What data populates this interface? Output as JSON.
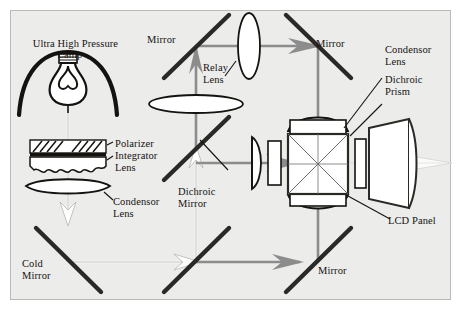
{
  "figure": {
    "title_label": "Ultra High Pressure\nLamp",
    "background_color": "#ececeb",
    "border_color": "#b9b9b7",
    "ink_color": "#15130f",
    "beam_color": "#8c8c8c",
    "output_beam_color": "#f2f2f2",
    "type": "optical-light-path-diagram"
  },
  "labels": {
    "lamp": "Ultra High Pressure\nLamp",
    "mirror_top_left": "Mirror",
    "mirror_top_right": "Mirror",
    "relay_lens": "Relay\nLens",
    "polarizer": "Polarizer",
    "integrator_lens": "Integrator\nLens",
    "condensor_lens_left": "Condensor\nLens",
    "dichroic_mirror": "Dichroic\nMirror",
    "cold_mirror": "Cold\nMirror",
    "condensor_lens_right": "Condensor\nLens",
    "dichroic_prism": "Dichroic\nPrism",
    "lcd_panel": "LCD Panel",
    "mirror_bottom_right": "Mirror"
  },
  "components": [
    {
      "name": "ultra-high-pressure-lamp",
      "label": "Ultra High Pressure Lamp",
      "kind": "source"
    },
    {
      "name": "polarizer",
      "label": "Polarizer",
      "kind": "optic"
    },
    {
      "name": "integrator-lens",
      "label": "Integrator Lens",
      "kind": "lens"
    },
    {
      "name": "condensor-lens-left",
      "label": "Condensor Lens",
      "kind": "lens"
    },
    {
      "name": "cold-mirror",
      "label": "Cold Mirror",
      "kind": "mirror"
    },
    {
      "name": "dichroic-mirror",
      "label": "Dichroic Mirror",
      "kind": "mirror"
    },
    {
      "name": "mirror-top-left",
      "label": "Mirror",
      "kind": "mirror"
    },
    {
      "name": "mirror-top-right",
      "label": "Mirror",
      "kind": "mirror"
    },
    {
      "name": "mirror-bottom-right",
      "label": "Mirror",
      "kind": "mirror"
    },
    {
      "name": "relay-lens",
      "label": "Relay Lens",
      "kind": "lens"
    },
    {
      "name": "condensor-lens-right",
      "label": "Condensor Lens",
      "kind": "lens"
    },
    {
      "name": "dichroic-prism",
      "label": "Dichroic Prism",
      "kind": "prism"
    },
    {
      "name": "lcd-panel",
      "label": "LCD Panel",
      "kind": "panel"
    },
    {
      "name": "projection-lens",
      "label": "",
      "kind": "lens"
    }
  ]
}
